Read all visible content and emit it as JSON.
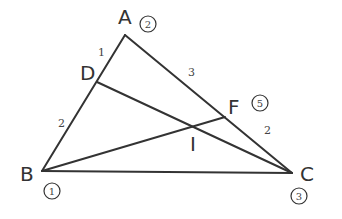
{
  "figure": {
    "type": "triangle-cevian-diagram",
    "points": {
      "A": {
        "label": "A",
        "weight": "2",
        "x": 125,
        "y": 35
      },
      "B": {
        "label": "B",
        "weight": "1",
        "x": 42,
        "y": 171
      },
      "C": {
        "label": "C",
        "weight": "3",
        "x": 292,
        "y": 173
      },
      "D": {
        "label": "D",
        "x": 97,
        "y": 82
      },
      "F": {
        "label": "F",
        "weight": "5",
        "x": 225,
        "y": 117
      },
      "I": {
        "label": "I",
        "x": 194,
        "y": 127
      }
    },
    "segment_labels": {
      "AD": "1",
      "DB": "2",
      "AF": "3",
      "FC": "2"
    },
    "segments": [
      "AB",
      "AC",
      "BC",
      "CD",
      "BF"
    ]
  }
}
